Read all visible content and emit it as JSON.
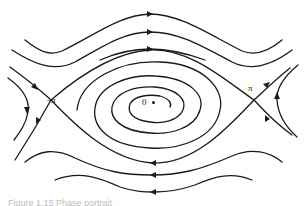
{
  "figure": {
    "type": "phase-portrait",
    "labels": {
      "origin": "0",
      "left_saddle": "−π",
      "right_saddle": "π"
    },
    "caption": "Figure 1.15  Phase portrait",
    "colors": {
      "stroke": "#1a1a1a",
      "background": "#ffffff",
      "caption": "#bdbdbd"
    }
  }
}
